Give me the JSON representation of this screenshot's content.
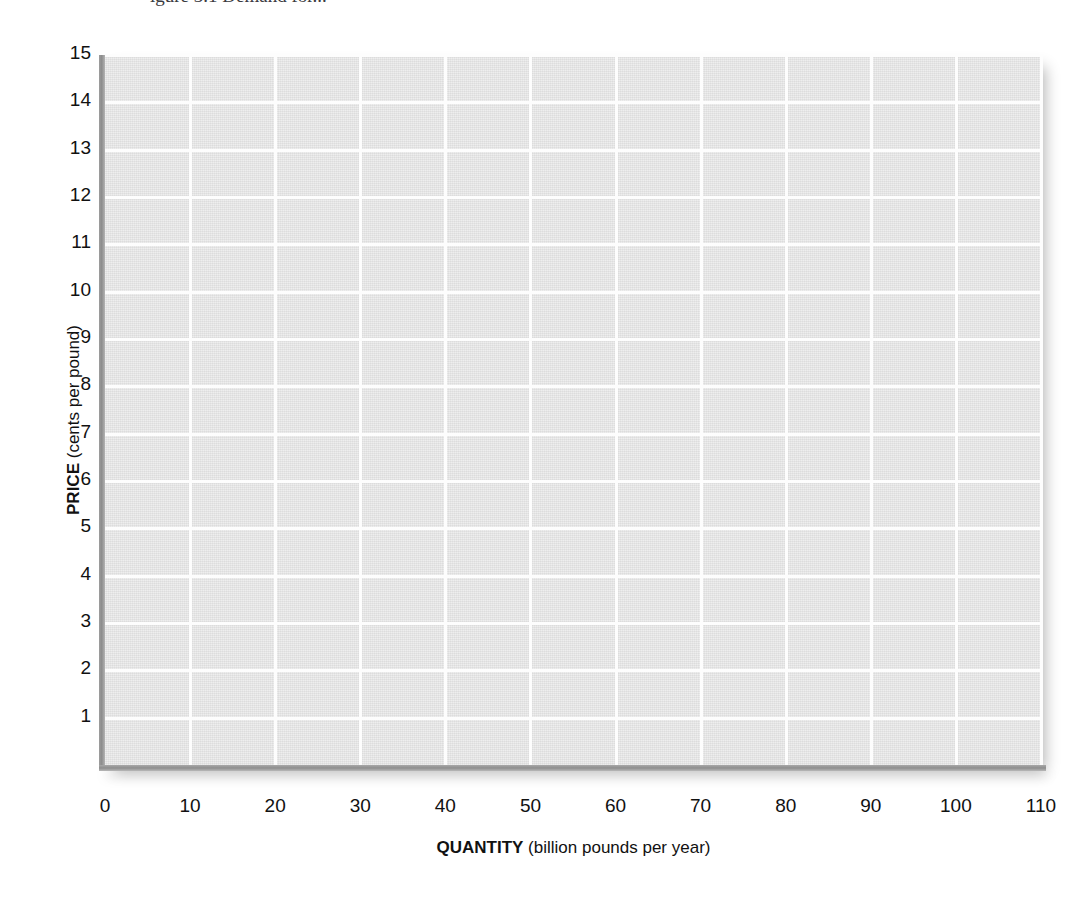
{
  "figure": {
    "caption_cut_off": "igure 3.1 Demand for...",
    "background_color": "#ffffff",
    "plot_background_color": "#e4e4e4",
    "gridline_color": "#fdfdfd",
    "axis_color": "#8e8e8e",
    "label_color": "#111111"
  },
  "chart_data": {
    "type": "line",
    "title": "",
    "subtitle": "",
    "xlabel_bold": "QUANTITY",
    "xlabel_rest": " (billion pounds per year)",
    "xlabel": "QUANTITY (billion pounds per year)",
    "ylabel_bold": "PRICE",
    "ylabel_rest": " (cents per pound)",
    "ylabel": "PRICE (cents per pound)",
    "xlim": [
      0,
      110
    ],
    "ylim": [
      0,
      15
    ],
    "xticks": [
      0,
      10,
      20,
      30,
      40,
      50,
      60,
      70,
      80,
      90,
      100,
      110
    ],
    "xtick_labels": [
      "0",
      "10",
      "20",
      "30",
      "40",
      "50",
      "60",
      "70",
      "80",
      "90",
      "100",
      "110"
    ],
    "yticks": [
      1,
      2,
      3,
      4,
      5,
      6,
      7,
      8,
      9,
      10,
      11,
      12,
      13,
      14,
      15
    ],
    "ytick_labels": [
      "15",
      "14",
      "13",
      "12",
      "11",
      "10",
      "9",
      "8",
      "7",
      "6",
      "5",
      "4",
      "3",
      "2",
      "1"
    ],
    "grid": true,
    "grid_color": "#ffffff",
    "legend": null,
    "legend_position": "none",
    "series": [],
    "annotations": [],
    "note": "Empty grid worksheet — no data series plotted"
  }
}
